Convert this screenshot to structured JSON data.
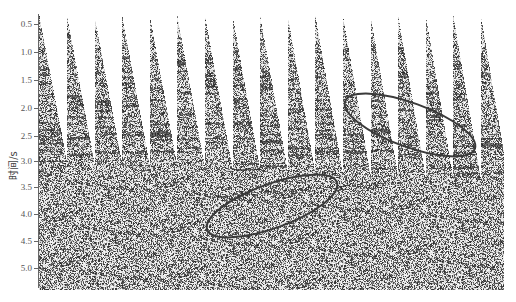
{
  "chart_data": {
    "type": "heatmap",
    "subtype": "seismic-shot-gather-panels",
    "title": "",
    "xlabel": "",
    "ylabel": "时间/s",
    "yticks": [
      "0.5",
      "1.0",
      "1.5",
      "2.0",
      "2.5",
      "3.0",
      "3.5",
      "4.0",
      "4.5",
      "5.0"
    ],
    "ytick_values": [
      0.5,
      1.0,
      1.5,
      2.0,
      2.5,
      3.0,
      3.5,
      4.0,
      4.5,
      5.0
    ],
    "ylim": [
      0.3,
      5.4
    ],
    "y_inverted": true,
    "panel_count": 18,
    "panel_shape": "wedge (first-break mute) widening with time; gaps close between ~3.0 s and ~3.4 s",
    "annotations": [
      {
        "shape": "ellipse",
        "label": "upper-right highlighted reflections",
        "center_time_s": 2.3,
        "approx_panels": [
          12,
          17
        ],
        "rotation_deg": 20
      },
      {
        "shape": "ellipse",
        "label": "lower-middle highlighted reflections",
        "center_time_s": 3.9,
        "approx_panels": [
          7,
          11
        ],
        "rotation_deg": -20
      }
    ],
    "grid": false,
    "colormap": "grayscale wiggle/variable-density"
  },
  "axis": {
    "ylabel": "时间/s",
    "ticks": [
      "0.5",
      "1.0",
      "1.5",
      "2.0",
      "2.5",
      "3.0",
      "3.5",
      "4.0",
      "4.5",
      "5.0"
    ]
  },
  "style": {
    "ellipse_color": "#3a3a3a",
    "axis_color": "#666666",
    "ink_color": "#2a2a2a",
    "paper_color": "#ffffff"
  }
}
